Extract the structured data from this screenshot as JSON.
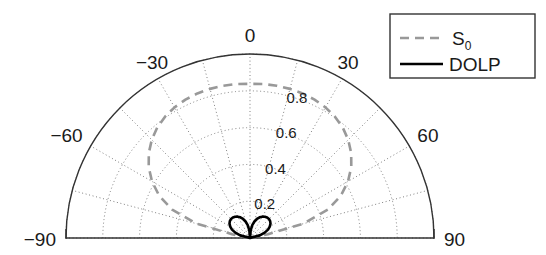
{
  "figure": {
    "type": "polar-half-plot",
    "background_color": "#ffffff"
  },
  "legend": {
    "position": "top-right",
    "border_color": "#333333",
    "entries": [
      {
        "label": "S",
        "sublabel": "0",
        "style": "dashed",
        "color": "#999999"
      },
      {
        "label": "DOLP",
        "sublabel": "",
        "style": "solid",
        "color": "#000000"
      }
    ]
  },
  "axes": {
    "angle_labels": [
      "-90",
      "-60",
      "-30",
      "0",
      "30",
      "60",
      "90"
    ],
    "angle_values": [
      -90,
      -60,
      -30,
      0,
      30,
      60,
      90
    ],
    "radial_labels": [
      "0.2",
      "0.4",
      "0.6",
      "0.8"
    ],
    "radial_values": [
      0.2,
      0.4,
      0.6,
      0.8
    ],
    "grid_color": "#808080",
    "outline_color": "#333333"
  },
  "chart_data": {
    "type": "line",
    "title": "",
    "xlabel": "Angle (degrees)",
    "ylabel": "Normalized value",
    "projection": "polar-half",
    "theta_range": [
      -90,
      90
    ],
    "rlim": [
      0,
      1.0
    ],
    "rticks": [
      0.2,
      0.4,
      0.6,
      0.8
    ],
    "thetaticks": [
      -90,
      -60,
      -30,
      0,
      30,
      60,
      90
    ],
    "grid": true,
    "legend_position": "upper right",
    "theta": [
      -90,
      -85,
      -80,
      -78,
      -75,
      -70,
      -65,
      -60,
      -55,
      -50,
      -45,
      -40,
      -35,
      -30,
      -25,
      -20,
      -15,
      -10,
      -5,
      0,
      5,
      10,
      15,
      20,
      25,
      30,
      35,
      40,
      45,
      50,
      55,
      60,
      65,
      70,
      75,
      78,
      80,
      85,
      90
    ],
    "series": [
      {
        "name": "S0",
        "style": "dashed",
        "color": "#999999",
        "values": [
          0.0,
          0.0,
          0.02,
          0.1,
          0.3,
          0.45,
          0.545,
          0.615,
          0.672,
          0.718,
          0.755,
          0.784,
          0.805,
          0.82,
          0.83,
          0.836,
          0.839,
          0.84,
          0.84,
          0.838,
          0.84,
          0.84,
          0.839,
          0.836,
          0.83,
          0.82,
          0.805,
          0.784,
          0.755,
          0.718,
          0.672,
          0.615,
          0.545,
          0.45,
          0.3,
          0.1,
          0.02,
          0.0,
          0.0
        ]
      },
      {
        "name": "DOLP",
        "style": "solid",
        "color": "#000000",
        "values": [
          0.0,
          0.0,
          0.0,
          0.0,
          0.055,
          0.085,
          0.108,
          0.124,
          0.136,
          0.143,
          0.146,
          0.145,
          0.141,
          0.134,
          0.124,
          0.11,
          0.093,
          0.071,
          0.042,
          0.0,
          0.042,
          0.071,
          0.093,
          0.11,
          0.124,
          0.134,
          0.141,
          0.145,
          0.146,
          0.143,
          0.136,
          0.124,
          0.108,
          0.085,
          0.055,
          0.0,
          0.0,
          0.0,
          0.0
        ]
      }
    ]
  },
  "geometry": {
    "center_x": 250,
    "center_y": 238,
    "radius": 184
  }
}
